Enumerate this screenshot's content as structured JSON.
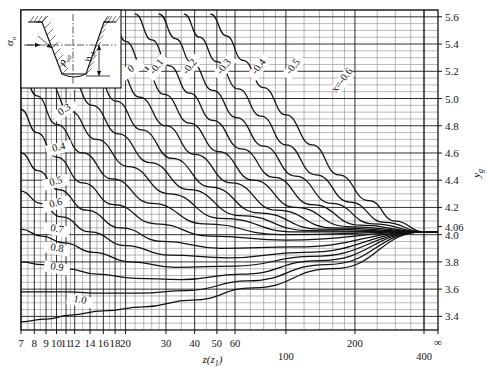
{
  "chart_data": {
    "type": "line",
    "title": "",
    "xlabel": "z(z1)",
    "ylabel": "yg",
    "xscale": "log",
    "xlim": [
      7,
      400
    ],
    "ylim": [
      3.3,
      5.65
    ],
    "grid": true,
    "legend_position": "inline-curve-labels",
    "x_ticks_major": [
      7,
      8,
      9,
      10,
      11,
      12,
      14,
      16,
      18,
      20,
      30,
      40,
      50,
      60,
      100,
      200,
      400
    ],
    "x_tick_labels": [
      "7",
      "8",
      "9",
      "10",
      "11",
      "12",
      "14",
      "16",
      "18",
      "20",
      "30",
      "40",
      "50",
      "60",
      "100",
      "200",
      "400"
    ],
    "x_tick_infinity": "∞",
    "y_ticks_major": [
      3.4,
      3.6,
      3.8,
      4.0,
      4.2,
      4.4,
      4.6,
      4.8,
      5.0,
      5.2,
      5.4,
      5.6
    ],
    "y_tick_labels": [
      "3.4",
      "3.6",
      "3.8",
      "4.0",
      "4.2",
      "4.4",
      "4.6",
      "4.8",
      "5.0",
      "5.2",
      "5.4",
      "5.6"
    ],
    "y_special_tick": 4.06,
    "y_special_tick_label": "4.06",
    "y_minor_step": 0.05,
    "convergence_point": {
      "x": 400,
      "y": 4.02
    },
    "series": [
      {
        "name": "x=-0.6",
        "label": "x=-0.6",
        "label_x": 180,
        "label_y": 5.12,
        "points": [
          [
            47,
            5.62
          ],
          [
            55,
            5.46
          ],
          [
            65,
            5.28
          ],
          [
            80,
            5.08
          ],
          [
            100,
            4.88
          ],
          [
            130,
            4.66
          ],
          [
            170,
            4.44
          ],
          [
            230,
            4.25
          ],
          [
            300,
            4.1
          ],
          [
            400,
            4.02
          ]
        ]
      },
      {
        "name": "-0.5",
        "label": "-0.5",
        "label_x": 110,
        "label_y": 5.22,
        "points": [
          [
            36,
            5.62
          ],
          [
            42,
            5.45
          ],
          [
            50,
            5.27
          ],
          [
            62,
            5.07
          ],
          [
            78,
            4.87
          ],
          [
            100,
            4.66
          ],
          [
            135,
            4.44
          ],
          [
            190,
            4.24
          ],
          [
            270,
            4.09
          ],
          [
            400,
            4.02
          ]
        ]
      },
      {
        "name": "-0.4",
        "label": "-0.4",
        "label_x": 78,
        "label_y": 5.22,
        "points": [
          [
            28,
            5.62
          ],
          [
            33,
            5.44
          ],
          [
            39,
            5.26
          ],
          [
            48,
            5.06
          ],
          [
            61,
            4.86
          ],
          [
            80,
            4.65
          ],
          [
            110,
            4.43
          ],
          [
            158,
            4.23
          ],
          [
            240,
            4.08
          ],
          [
            400,
            4.02
          ]
        ]
      },
      {
        "name": "-0.3",
        "label": "-0.3",
        "label_x": 55,
        "label_y": 5.22,
        "points": [
          [
            22,
            5.62
          ],
          [
            26,
            5.43
          ],
          [
            31,
            5.24
          ],
          [
            38,
            5.04
          ],
          [
            48,
            4.84
          ],
          [
            64,
            4.63
          ],
          [
            89,
            4.42
          ],
          [
            130,
            4.22
          ],
          [
            210,
            4.07
          ],
          [
            400,
            4.02
          ]
        ]
      },
      {
        "name": "-0.2",
        "label": "-0.2",
        "label_x": 39,
        "label_y": 5.22,
        "points": [
          [
            17.2,
            5.62
          ],
          [
            20,
            5.42
          ],
          [
            24,
            5.23
          ],
          [
            29.5,
            5.03
          ],
          [
            38,
            4.82
          ],
          [
            51,
            4.61
          ],
          [
            72,
            4.4
          ],
          [
            110,
            4.2
          ],
          [
            185,
            4.06
          ],
          [
            400,
            4.02
          ]
        ]
      },
      {
        "name": "-0.1",
        "label": "-0.1",
        "label_x": 28,
        "label_y": 5.22,
        "points": [
          [
            13.4,
            5.62
          ],
          [
            15.7,
            5.41
          ],
          [
            18.7,
            5.21
          ],
          [
            23,
            5.01
          ],
          [
            30,
            4.8
          ],
          [
            40,
            4.59
          ],
          [
            58,
            4.38
          ],
          [
            91,
            4.18
          ],
          [
            160,
            4.05
          ],
          [
            400,
            4.02
          ]
        ]
      },
      {
        "name": "0",
        "label": "0",
        "label_x": 21.5,
        "label_y": 5.2,
        "points": [
          [
            10.5,
            5.62
          ],
          [
            12.3,
            5.4
          ],
          [
            14.7,
            5.19
          ],
          [
            18.2,
            4.98
          ],
          [
            23.5,
            4.77
          ],
          [
            32,
            4.56
          ],
          [
            47,
            4.35
          ],
          [
            76,
            4.16
          ],
          [
            140,
            4.04
          ],
          [
            400,
            4.02
          ]
        ]
      },
      {
        "name": "0.1",
        "label": "0.1",
        "label_x": 16.0,
        "label_y": 5.18,
        "points": [
          [
            8.2,
            5.62
          ],
          [
            9.6,
            5.38
          ],
          [
            11.5,
            5.16
          ],
          [
            14.3,
            4.95
          ],
          [
            18.6,
            4.74
          ],
          [
            25.5,
            4.53
          ],
          [
            38,
            4.33
          ],
          [
            63,
            4.14
          ],
          [
            125,
            4.03
          ],
          [
            400,
            4.02
          ]
        ]
      },
      {
        "name": "0.2",
        "label": "0.2",
        "label_x": 12.6,
        "label_y": 5.12,
        "points": [
          [
            7,
            5.54
          ],
          [
            7.7,
            5.35
          ],
          [
            9.2,
            5.13
          ],
          [
            11.4,
            4.91
          ],
          [
            14.9,
            4.7
          ],
          [
            20.6,
            4.5
          ],
          [
            31,
            4.3
          ],
          [
            52,
            4.12
          ],
          [
            110,
            4.02
          ],
          [
            400,
            4.02
          ]
        ]
      },
      {
        "name": "0.3",
        "label": "0.3",
        "label_x": 11.0,
        "label_y": 4.9,
        "points": [
          [
            7,
            5.22
          ],
          [
            8.2,
            5.02
          ],
          [
            10,
            4.81
          ],
          [
            13,
            4.6
          ],
          [
            17.5,
            4.41
          ],
          [
            26,
            4.23
          ],
          [
            44,
            4.08
          ],
          [
            95,
            4.0
          ],
          [
            400,
            4.02
          ]
        ]
      },
      {
        "name": "0.4",
        "label": "0.4",
        "label_x": 10.3,
        "label_y": 4.62,
        "points": [
          [
            7,
            4.92
          ],
          [
            8.2,
            4.75
          ],
          [
            10,
            4.57
          ],
          [
            13,
            4.38
          ],
          [
            17.8,
            4.22
          ],
          [
            27,
            4.08
          ],
          [
            47,
            3.99
          ],
          [
            100,
            3.96
          ],
          [
            400,
            4.02
          ]
        ]
      },
      {
        "name": "0.5",
        "label": "0.5",
        "label_x": 10.0,
        "label_y": 4.37,
        "points": [
          [
            7,
            4.6
          ],
          [
            8.3,
            4.47
          ],
          [
            10.2,
            4.33
          ],
          [
            13.5,
            4.18
          ],
          [
            19,
            4.05
          ],
          [
            29,
            3.95
          ],
          [
            52,
            3.9
          ],
          [
            110,
            3.91
          ],
          [
            400,
            4.02
          ]
        ]
      },
      {
        "name": "0.6",
        "label": "0.6",
        "label_x": 10.0,
        "label_y": 4.21,
        "points": [
          [
            7,
            4.32
          ],
          [
            8.5,
            4.23
          ],
          [
            10.5,
            4.13
          ],
          [
            14,
            4.02
          ],
          [
            20,
            3.92
          ],
          [
            31,
            3.85
          ],
          [
            56,
            3.83
          ],
          [
            120,
            3.87
          ],
          [
            400,
            4.02
          ]
        ]
      },
      {
        "name": "0.7",
        "label": "0.7",
        "label_x": 10.0,
        "label_y": 4.02,
        "points": [
          [
            7,
            4.04
          ],
          [
            8.6,
            3.99
          ],
          [
            10.8,
            3.94
          ],
          [
            14.5,
            3.87
          ],
          [
            21,
            3.8
          ],
          [
            33,
            3.76
          ],
          [
            60,
            3.77
          ],
          [
            130,
            3.84
          ],
          [
            400,
            4.02
          ]
        ]
      },
      {
        "name": "0.8",
        "label": "0.8",
        "label_x": 10.0,
        "label_y": 3.88,
        "points": [
          [
            7,
            3.8
          ],
          [
            8.7,
            3.78
          ],
          [
            11,
            3.75
          ],
          [
            15,
            3.71
          ],
          [
            22,
            3.68
          ],
          [
            35,
            3.67
          ],
          [
            64,
            3.71
          ],
          [
            140,
            3.81
          ],
          [
            400,
            4.02
          ]
        ]
      },
      {
        "name": "0.9",
        "label": "0.9",
        "label_x": 10.0,
        "label_y": 3.74,
        "points": [
          [
            7,
            3.58
          ],
          [
            8.8,
            3.58
          ],
          [
            11.2,
            3.58
          ],
          [
            15.5,
            3.57
          ],
          [
            23,
            3.57
          ],
          [
            37,
            3.59
          ],
          [
            68,
            3.66
          ],
          [
            150,
            3.78
          ],
          [
            400,
            4.02
          ]
        ]
      },
      {
        "name": "1.0",
        "label": "1.0",
        "label_x": 12.6,
        "label_y": 3.5,
        "points": [
          [
            7,
            3.36
          ],
          [
            9,
            3.38
          ],
          [
            11.5,
            3.41
          ],
          [
            16,
            3.44
          ],
          [
            24,
            3.47
          ],
          [
            39,
            3.52
          ],
          [
            72,
            3.61
          ],
          [
            160,
            3.75
          ],
          [
            400,
            4.02
          ]
        ]
      }
    ]
  },
  "inset": {
    "name": "tooth-space-diagram",
    "alpha_label": "α",
    "alpha_sub": "n",
    "h_label": "h",
    "h_sub": "sl",
    "rho_label": "ρ",
    "rho_sub": "a0"
  },
  "axes": {
    "x_title": "z(z",
    "x_title_sub": "1",
    "x_title_close": ")",
    "y_title": "y",
    "y_title_sub": "g"
  }
}
